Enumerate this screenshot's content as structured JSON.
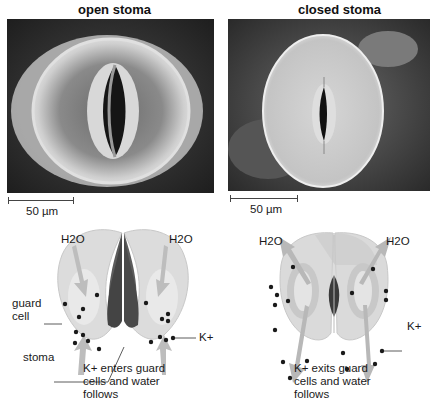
{
  "panels": {
    "open": {
      "title": "open stoma",
      "scale_label": "50 µm",
      "diagram": {
        "water_left": "H2O",
        "water_right": "H2O",
        "guard_cell_label_line1": "guard",
        "guard_cell_label_line2": "cell",
        "ion_label": "K+",
        "stoma_label": "stoma",
        "caption_line1": "K+ enters guard",
        "caption_line2": "cells and water",
        "caption_line3": "follows"
      }
    },
    "closed": {
      "title": "closed stoma",
      "scale_label": "50 µm",
      "diagram": {
        "water_left": "H2O",
        "water_right": "H2O",
        "ion_label": "K+",
        "caption_line1": "K+ exits guard",
        "caption_line2": "cells and water",
        "caption_line3": "follows"
      }
    }
  },
  "colors": {
    "cell_fill": "#d9d9d9",
    "cell_inner": "#c2c2c2",
    "pore_dark": "#5a5a5a",
    "arrow": "#b8b8b8",
    "ion_dot": "#1a1a1a"
  }
}
